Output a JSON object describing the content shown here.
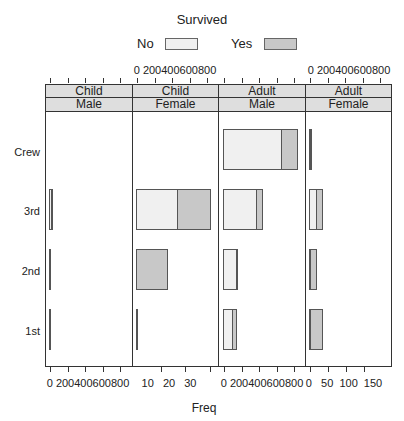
{
  "legend": {
    "title": "Survived",
    "items": [
      {
        "label": "No",
        "color": "#f0f0f0"
      },
      {
        "label": "Yes",
        "color": "#c8c8c8"
      }
    ]
  },
  "colors": {
    "no": "#f0f0f0",
    "yes": "#c8c8c8",
    "strip": "#dedede",
    "border": "#333333"
  },
  "axis": {
    "xlabel": "Freq",
    "ylabel": ""
  },
  "top_tick_labels": [
    "0",
    "200400600800"
  ],
  "panels": [
    {
      "strip_top": "Child",
      "strip_bottom": "Male",
      "tick_labels": "0 200400600800",
      "tick_position": "bottom"
    },
    {
      "strip_top": "Child",
      "strip_bottom": "Female",
      "tick_labels": "0 200400600800",
      "tick_position": "top"
    },
    {
      "strip_top": "Adult",
      "strip_bottom": "Male",
      "tick_labels": "0 200400600800",
      "tick_position": "bottom"
    },
    {
      "strip_top": "Adult",
      "strip_bottom": "Female",
      "tick_labels": "0 200400600800",
      "tick_position": "top"
    }
  ],
  "bottom_axes": [
    {
      "labels": [
        "0",
        "200",
        "400",
        "600",
        "800"
      ],
      "text": "0 200400600800"
    },
    {
      "labels": [
        "10",
        "20",
        "30"
      ],
      "text": "10  20  30"
    },
    {
      "labels": [
        "0",
        "200",
        "400",
        "600",
        "800"
      ],
      "text": "0 200400600800"
    },
    {
      "labels": [
        "0",
        "50",
        "100",
        "150"
      ],
      "text": "0   50  100  150"
    }
  ],
  "chart_data": {
    "type": "bar",
    "orientation": "horizontal",
    "stacked": true,
    "title": "",
    "legend_title": "Survived",
    "legend_position": "top",
    "xlabel": "Freq",
    "ylabel": "",
    "categories": [
      "1st",
      "2nd",
      "3rd",
      "Crew"
    ],
    "series_names": [
      "No",
      "Yes"
    ],
    "panels": [
      {
        "age": "Child",
        "sex": "Male",
        "xlim": [
          0,
          900
        ],
        "series": [
          {
            "name": "No",
            "values": [
              0,
              0,
              35,
              0
            ]
          },
          {
            "name": "Yes",
            "values": [
              5,
              11,
              13,
              0
            ]
          }
        ]
      },
      {
        "age": "Child",
        "sex": "Female",
        "xlim": [
          0,
          33
        ],
        "series": [
          {
            "name": "No",
            "values": [
              0,
              0,
              17,
              0
            ]
          },
          {
            "name": "Yes",
            "values": [
              1,
              13,
              14,
              0
            ]
          }
        ]
      },
      {
        "age": "Adult",
        "sex": "Male",
        "xlim": [
          0,
          900
        ],
        "series": [
          {
            "name": "No",
            "values": [
              118,
              154,
              387,
              670
            ]
          },
          {
            "name": "Yes",
            "values": [
              57,
              14,
              75,
              192
            ]
          }
        ]
      },
      {
        "age": "Adult",
        "sex": "Female",
        "xlim": [
          0,
          170
        ],
        "series": [
          {
            "name": "No",
            "values": [
              4,
              13,
              89,
              3
            ]
          },
          {
            "name": "Yes",
            "values": [
              140,
              80,
              76,
              20
            ]
          }
        ]
      }
    ],
    "tick_labels": {
      "panel1": [
        "0",
        "200",
        "400",
        "600",
        "800"
      ],
      "panel2": [
        "10",
        "20",
        "30"
      ],
      "panel3": [
        "0",
        "200",
        "400",
        "600",
        "800"
      ],
      "panel4": [
        "0",
        "50",
        "100",
        "150"
      ]
    }
  }
}
